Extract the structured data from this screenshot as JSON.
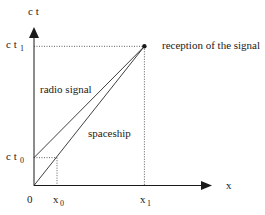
{
  "diagram": {
    "type": "spacetime-diagram",
    "axes": {
      "vertical_label": "c t",
      "horizontal_label": "x",
      "origin_label": "0"
    },
    "ticks": {
      "ct0": {
        "base": "c t",
        "sub": "0"
      },
      "ct1": {
        "base": "c t",
        "sub": "1"
      },
      "x0": {
        "base": "x",
        "sub": "0"
      },
      "x1": {
        "base": "x",
        "sub": "1"
      }
    },
    "lines": {
      "radio_signal": "radio signal",
      "spaceship": "spaceship"
    },
    "event_label": "reception of the signal",
    "geometry_data": {
      "x0": 1,
      "x1": 4.8,
      "ct0": 1.2,
      "ct1": 6,
      "x_max": 7.7,
      "ct_max": 6.8
    },
    "colors": {
      "ink": "#1a1a1a",
      "background": "#ffffff"
    }
  }
}
